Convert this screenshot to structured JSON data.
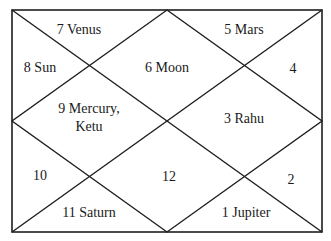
{
  "chart": {
    "type": "north-indian-horoscope",
    "line_color": "#1e1e1e",
    "houses": [
      {
        "label": "7 Venus",
        "x": 79,
        "y": 29
      },
      {
        "label": "5 Mars",
        "x": 244,
        "y": 29
      },
      {
        "label": "8 Sun",
        "x": 40,
        "y": 67
      },
      {
        "label": "6 Moon",
        "x": 167,
        "y": 67
      },
      {
        "label": "4",
        "x": 293,
        "y": 68
      },
      {
        "label": "9 Mercury,",
        "x": 89,
        "y": 108
      },
      {
        "label": "Ketu",
        "x": 89,
        "y": 126
      },
      {
        "label": "3 Rahu",
        "x": 244,
        "y": 118
      },
      {
        "label": "10",
        "x": 40,
        "y": 175
      },
      {
        "label": "12",
        "x": 169,
        "y": 176
      },
      {
        "label": "2",
        "x": 291,
        "y": 179
      },
      {
        "label": "11 Saturn",
        "x": 89,
        "y": 212
      },
      {
        "label": "1 Jupiter",
        "x": 246,
        "y": 212
      }
    ]
  }
}
